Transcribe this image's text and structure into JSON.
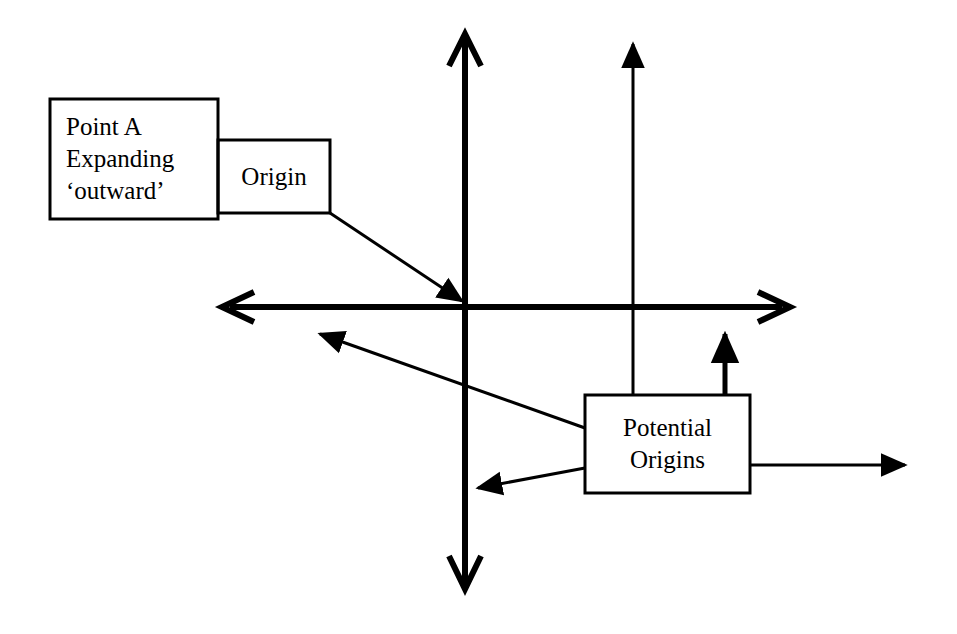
{
  "diagram": {
    "background_color": "#ffffff",
    "stroke_color": "#000000",
    "boxes": [
      {
        "id": "point-a",
        "text": "Point A\nExpanding\n‘outward’",
        "x": 50,
        "y": 99,
        "width": 168,
        "height": 120
      },
      {
        "id": "origin",
        "text": "Origin",
        "x": 218,
        "y": 140,
        "width": 112,
        "height": 73
      },
      {
        "id": "potential-origins",
        "text": "Potential\nOrigins",
        "x": 585,
        "y": 395,
        "width": 165,
        "height": 98
      }
    ],
    "axes": {
      "vertical": {
        "x": 465,
        "y_top": 32,
        "y_bottom": 590,
        "arrowhead_style": "open-chevron",
        "arrowheads": [
          "top",
          "bottom"
        ]
      },
      "horizontal": {
        "y": 307,
        "x_left": 222,
        "x_right": 790,
        "arrowhead_style": "open-chevron",
        "arrowheads": [
          "left",
          "right"
        ]
      },
      "origin_point": {
        "x": 465,
        "y": 307
      }
    },
    "connectors": [
      {
        "id": "origin-leader",
        "from": "origin box bottom-right corner",
        "to": "axis origin point",
        "arrowhead_style": "filled-triangle"
      },
      {
        "id": "potential-origin-upper-left-ray",
        "from": "potential origins box left edge",
        "to": "upper-left quadrant",
        "arrowhead_style": "filled-triangle"
      },
      {
        "id": "potential-origin-lower-left-ray",
        "from": "potential origins box left edge",
        "to": "vertical axis below origin",
        "arrowhead_style": "filled-triangle"
      },
      {
        "id": "potential-origin-tall-up-ray",
        "from": "potential origins box top",
        "to": "top of figure",
        "arrowhead_style": "filled-triangle"
      },
      {
        "id": "potential-origin-short-up-ray",
        "from": "potential origins box top",
        "to": "just above horizontal axis",
        "arrowhead_style": "filled-triangle"
      },
      {
        "id": "potential-origin-right-ray",
        "from": "potential origins box right edge",
        "to": "right of figure",
        "arrowhead_style": "filled-triangle"
      }
    ]
  }
}
